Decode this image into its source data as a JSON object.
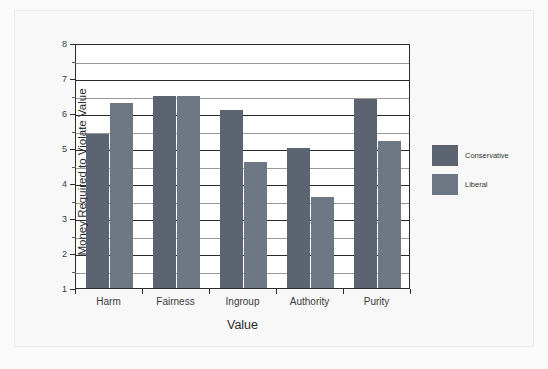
{
  "chart_data": {
    "type": "bar",
    "title": "",
    "subtitle": "",
    "xlabel": "Value",
    "ylabel": "Money Required to Violate Value",
    "categories": [
      "Harm",
      "Fairness",
      "Ingroup",
      "Authority",
      "Purity"
    ],
    "series": [
      {
        "name": "Conservative",
        "color": "#5b6470",
        "values": [
          5.4,
          6.5,
          6.1,
          5.0,
          6.4
        ]
      },
      {
        "name": "Liberal",
        "color": "#6e7884",
        "values": [
          6.3,
          6.5,
          4.6,
          3.6,
          5.2
        ]
      }
    ],
    "ylim": [
      1,
      8
    ],
    "y_major_ticks": [
      1,
      2,
      3,
      4,
      5,
      6,
      7,
      8
    ],
    "y_minor_ticks": [
      1.5,
      2.5,
      3.5,
      4.5,
      5.5,
      6.5,
      7.5
    ],
    "y_tick_labels": [
      "1",
      "2",
      "3",
      "4",
      "5",
      "6",
      "7",
      "8"
    ],
    "grid": true,
    "grid_axis": "y",
    "legend_position": "right",
    "legend_entries": [
      "Conservative",
      "Liberal"
    ],
    "bar_baseline": 1,
    "background_color": "#ffffff",
    "axis_color": "#2b2b2b",
    "minor_grid_color": "#9a9a9a"
  }
}
